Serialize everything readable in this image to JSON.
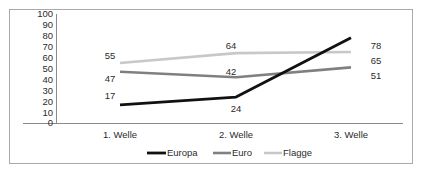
{
  "chart_data": {
    "type": "line",
    "title": "",
    "subtitle": "",
    "xlabel": "",
    "ylabel": "",
    "categories": [
      "1. Welle",
      "2. Welle",
      "3. Welle"
    ],
    "series": [
      {
        "name": "Europa",
        "values": [
          17,
          24,
          78
        ],
        "color": "#111111"
      },
      {
        "name": "Euro",
        "values": [
          47,
          42,
          51
        ],
        "color": "#808080"
      },
      {
        "name": "Flagge",
        "values": [
          55,
          64,
          65
        ],
        "color": "#c8c8c8"
      }
    ],
    "ylim": [
      0,
      100
    ],
    "yticks": [
      100,
      90,
      80,
      70,
      60,
      50,
      40,
      30,
      20,
      10,
      0
    ],
    "ytick_labels": [
      "100",
      "90",
      "80",
      "70",
      "60",
      "50",
      "40",
      "30",
      "20",
      "10",
      "0"
    ],
    "grid": false,
    "legend_position": "bottom",
    "data_labels": {
      "Europa": [
        "17",
        "24",
        "78"
      ],
      "Euro": [
        "47",
        "42",
        "51"
      ],
      "Flagge": [
        "55",
        "64",
        "65"
      ]
    }
  },
  "legend": {
    "items": [
      {
        "label": "Europa",
        "color": "#111111"
      },
      {
        "label": "Euro",
        "color": "#808080"
      },
      {
        "label": "Flagge",
        "color": "#c8c8c8"
      }
    ]
  },
  "frame": {
    "border_color": "#a9a9a9",
    "background": "#ffffff"
  }
}
